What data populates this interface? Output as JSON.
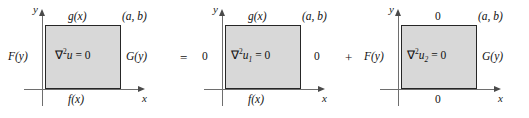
{
  "figure": {
    "type": "boundary-value-problem-superposition",
    "axis": {
      "x_label": "x",
      "y_label": "y"
    },
    "operators": {
      "equals": "=",
      "plus": "+"
    },
    "panels": [
      {
        "id": "original",
        "interior_prefix": "∇",
        "interior_exponent": "2",
        "interior_variable": "u",
        "interior_subscript": "",
        "interior_suffix": " = 0",
        "top": "g(x)",
        "bottom": "f(x)",
        "left": "F(y)",
        "right": "G(y)",
        "corner": "(a, b)",
        "top_upright": false,
        "bottom_upright": false,
        "left_upright": false,
        "right_upright": false
      },
      {
        "id": "subproblem-1",
        "interior_prefix": "∇",
        "interior_exponent": "2",
        "interior_variable": "u",
        "interior_subscript": "1",
        "interior_suffix": " = 0",
        "top": "g(x)",
        "bottom": "f(x)",
        "left": "0",
        "right": "0",
        "corner": "(a, b)",
        "top_upright": false,
        "bottom_upright": false,
        "left_upright": true,
        "right_upright": true
      },
      {
        "id": "subproblem-2",
        "interior_prefix": "∇",
        "interior_exponent": "2",
        "interior_variable": "u",
        "interior_subscript": "2",
        "interior_suffix": " = 0",
        "top": "0",
        "bottom": "0",
        "left": "F(y)",
        "right": "G(y)",
        "corner": "(a, b)",
        "top_upright": true,
        "bottom_upright": true,
        "left_upright": false,
        "right_upright": false
      }
    ],
    "colors": {
      "domain_fill": "#d8d8d8",
      "domain_border": "#262626",
      "axis": "#6e6e6e",
      "text": "#111111",
      "background": "#ffffff"
    }
  }
}
